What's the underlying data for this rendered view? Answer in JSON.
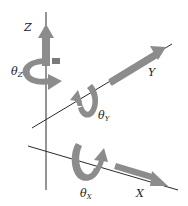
{
  "diagram": {
    "colors": {
      "background": "#ffffff",
      "axis_line": "#2a2a2a",
      "arrow_fill": "#8c8c8c",
      "arrow_dark": "#6e6e6e",
      "label": "#222222"
    },
    "axes": [
      {
        "id": "Z",
        "label": "Z",
        "rotation_label": "θ",
        "rotation_sub": "Z"
      },
      {
        "id": "Y",
        "label": "Y",
        "rotation_label": "θ",
        "rotation_sub": "Y"
      },
      {
        "id": "X",
        "label": "X",
        "rotation_label": "θ",
        "rotation_sub": "X"
      }
    ]
  }
}
